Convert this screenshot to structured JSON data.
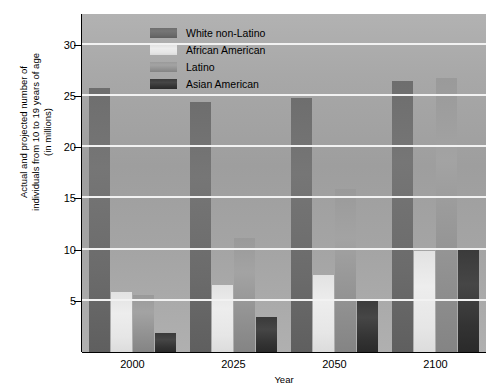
{
  "chart_data": {
    "type": "bar",
    "title": "",
    "xlabel": "Year",
    "ylabel": "Actual and projected number of\nindividuals from 10 to 19 years of age\n(in millions)",
    "categories": [
      "2000",
      "2025",
      "2050",
      "2100"
    ],
    "ylim": [
      0,
      33
    ],
    "yticks": [
      5,
      10,
      15,
      20,
      25,
      30
    ],
    "ytick_labels": [
      "5",
      "10",
      "15",
      "20",
      "25",
      "30"
    ],
    "grid": true,
    "legend_position": "top-center",
    "series": [
      {
        "name": "White non-Latino",
        "color": "#6e6e6e",
        "values": [
          25.8,
          24.4,
          24.8,
          26.5
        ]
      },
      {
        "name": "African American",
        "color": "#ededed",
        "values": [
          5.9,
          6.5,
          7.5,
          9.9
        ]
      },
      {
        "name": "Latino",
        "color": "#9a9a9a",
        "values": [
          5.6,
          11.1,
          15.9,
          26.8
        ]
      },
      {
        "name": "Asian American",
        "color": "#3a3a3a",
        "values": [
          1.9,
          3.4,
          5.2,
          10.2
        ]
      }
    ]
  },
  "legend": {
    "items": [
      {
        "label": "White non-Latino",
        "swatch": "swatch-white"
      },
      {
        "label": "African American",
        "swatch": "swatch-african"
      },
      {
        "label": "Latino",
        "swatch": "swatch-latino"
      },
      {
        "label": "Asian American",
        "swatch": "swatch-asian"
      }
    ]
  }
}
